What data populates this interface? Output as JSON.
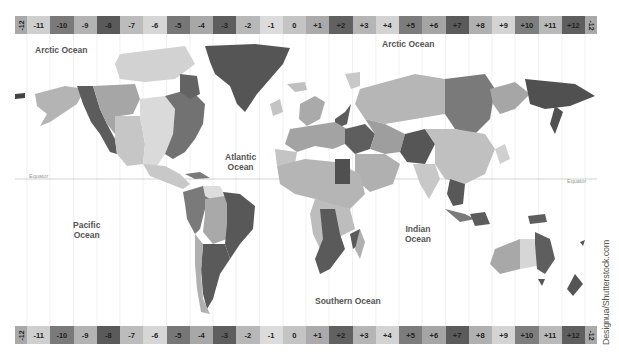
{
  "map": {
    "title": "World Time Zones Map",
    "timezone_strip": {
      "cells": [
        {
          "label": "-12",
          "color": "#a9a9a9",
          "half": true,
          "side": "l"
        },
        {
          "label": "-11",
          "color": "#cfcfcf"
        },
        {
          "label": "-10",
          "color": "#7a7a7a"
        },
        {
          "label": "-9",
          "color": "#b3b3b3"
        },
        {
          "label": "-8",
          "color": "#5a5a5a"
        },
        {
          "label": "-7",
          "color": "#bcbcbc"
        },
        {
          "label": "-6",
          "color": "#d6d6d6"
        },
        {
          "label": "-5",
          "color": "#777777"
        },
        {
          "label": "-4",
          "color": "#a8a8a8"
        },
        {
          "label": "-3",
          "color": "#5e5e5e"
        },
        {
          "label": "-2",
          "color": "#b8b8b8"
        },
        {
          "label": "-1",
          "color": "#dcdcdc"
        },
        {
          "label": "0",
          "color": "#c4c4c4"
        },
        {
          "label": "+1",
          "color": "#aaaaaa"
        },
        {
          "label": "+2",
          "color": "#616161"
        },
        {
          "label": "+3",
          "color": "#b5b5b5"
        },
        {
          "label": "+4",
          "color": "#d3d3d3"
        },
        {
          "label": "+5",
          "color": "#7c7c7c"
        },
        {
          "label": "+6",
          "color": "#a5a5a5"
        },
        {
          "label": "+7",
          "color": "#5b5b5b"
        },
        {
          "label": "+8",
          "color": "#b0b0b0"
        },
        {
          "label": "+9",
          "color": "#d4d4d4"
        },
        {
          "label": "+10",
          "color": "#7e7e7e"
        },
        {
          "label": "+11",
          "color": "#b9b9b9"
        },
        {
          "label": "+12",
          "color": "#5f5f5f"
        },
        {
          "label": "-12",
          "color": "#a9a9a9",
          "half": true,
          "side": "r"
        }
      ]
    },
    "oceans": [
      {
        "name": "Arctic Ocean",
        "line1": "Arctic Ocean",
        "line2": "",
        "x": 20,
        "y": 45
      },
      {
        "name": "Arctic Ocean East",
        "line1": "Arctic Ocean",
        "line2": "",
        "x": 380,
        "y": 40
      },
      {
        "name": "Atlantic Ocean",
        "line1": "Atlantic",
        "line2": "Ocean",
        "x": 223,
        "y": 151
      },
      {
        "name": "Pacific Ocean",
        "line1": "Pacific",
        "line2": "Ocean",
        "x": 72,
        "y": 218
      },
      {
        "name": "Indian Ocean",
        "line1": "Indian",
        "line2": "Ocean",
        "x": 403,
        "y": 225
      },
      {
        "name": "Southern Ocean",
        "line1": "Southern Ocean",
        "line2": "",
        "x": 313,
        "y": 296
      }
    ],
    "equator": {
      "left_label": "Equator",
      "right_label": "Equator"
    },
    "attribution": "Designua/Shutterstock.com"
  }
}
